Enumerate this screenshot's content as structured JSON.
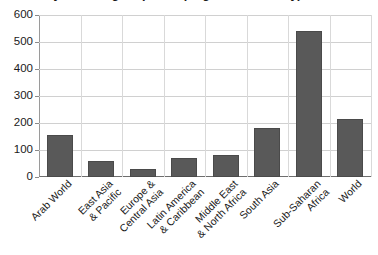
{
  "chart_data": {
    "type": "bar",
    "title_line_1": "by world region (developing countries only) 2013",
    "title_visible_text": "by world region (developing countries only) 2013",
    "categories": [
      "Arab World",
      "East Asia & Pacific",
      "Europe & Central Asia",
      "Latin America & Caribbean",
      "Middle East & North Africa",
      "South Asia",
      "Sub-Saharan Africa",
      "World"
    ],
    "category_lines": [
      [
        "Arab World"
      ],
      [
        "East Asia",
        "& Pacific"
      ],
      [
        "Europe &",
        "Central Asia"
      ],
      [
        "Latin America",
        "& Caribbean"
      ],
      [
        "Middle East",
        "& North Africa"
      ],
      [
        "South Asia"
      ],
      [
        "Sub-Saharan",
        "Africa"
      ],
      [
        "World"
      ]
    ],
    "values": [
      155,
      60,
      30,
      70,
      82,
      182,
      542,
      215
    ],
    "xlabel": "",
    "ylabel": "",
    "ylim": [
      0,
      600
    ],
    "yticks": [
      0,
      100,
      200,
      300,
      400,
      500,
      600
    ],
    "ytick_labels": [
      "0",
      "100",
      "200",
      "300",
      "400",
      "500",
      "600"
    ],
    "grid": "horizontal-and-vertical",
    "legend": "none",
    "bar_color": "#595959",
    "gridline_color": "#d0d0d0",
    "axis_color": "#6e6e6e",
    "background": "#ffffff"
  }
}
